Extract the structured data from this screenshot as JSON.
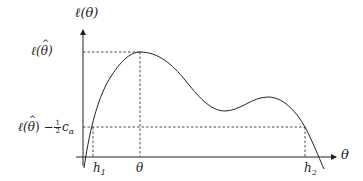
{
  "figure": {
    "y_axis_label": "ℓ(θ)",
    "x_axis_label": "θ",
    "max_label_prefix": "ℓ(",
    "max_label_theta": "θ",
    "max_label_suffix": ")",
    "threshold_label_prefix": "ℓ(",
    "threshold_label_theta": "θ",
    "threshold_label_mid": ") −",
    "threshold_frac_num": "1",
    "threshold_frac_den": "2",
    "threshold_label_c": "c",
    "threshold_label_c_sub": "α",
    "h1_label": "h",
    "h1_sub": "1",
    "h2_label": "h",
    "h2_sub": "2",
    "theta_hat_tick_label": "θ"
  },
  "colors": {
    "stroke": "#222222",
    "background": "#ffffff"
  }
}
